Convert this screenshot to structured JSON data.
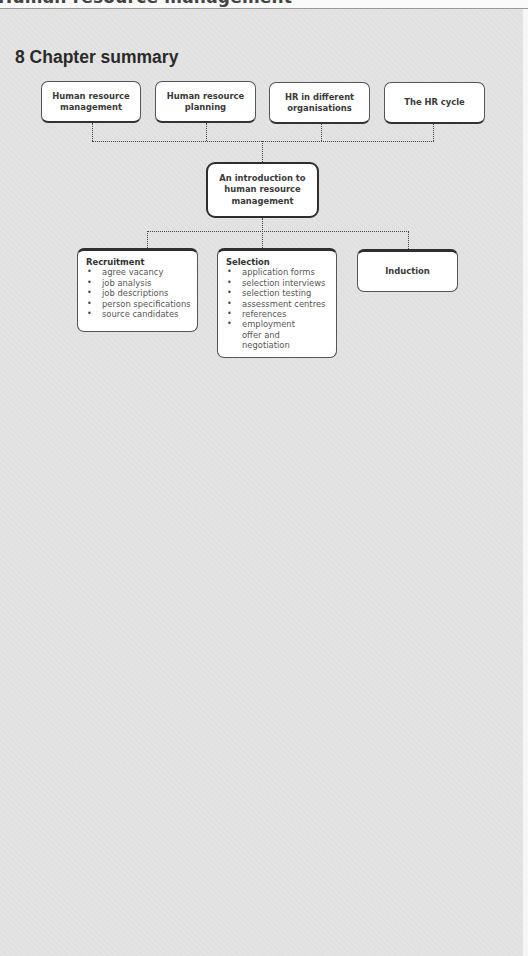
{
  "header": {
    "running_title": "Human resource management"
  },
  "section": {
    "title": "8 Chapter summary"
  },
  "diagram": {
    "top_boxes": [
      {
        "label": "Human resource\nmanagement"
      },
      {
        "label": "Human resource\nplanning"
      },
      {
        "label": "HR in different\norganisations"
      },
      {
        "label": "The HR cycle"
      }
    ],
    "center_box": {
      "label": "An introduction to\nhuman resource\nmanagement"
    },
    "lower_boxes": [
      {
        "heading": "Recruitment",
        "items": [
          "agree vacancy",
          "job analysis",
          "job descriptions",
          "person specifications",
          "source candidates"
        ]
      },
      {
        "heading": "Selection",
        "items": [
          "application forms",
          "selection interviews",
          "selection testing",
          "assessment centres",
          "references",
          "employment offer and negotiation"
        ]
      },
      {
        "heading": "Induction",
        "items": []
      }
    ],
    "bullet_glyph": "•"
  },
  "colors": {
    "paper": "#e3e3e3",
    "box_fill": "#ffffff",
    "border": "#333333",
    "text": "#3a3a3a"
  }
}
